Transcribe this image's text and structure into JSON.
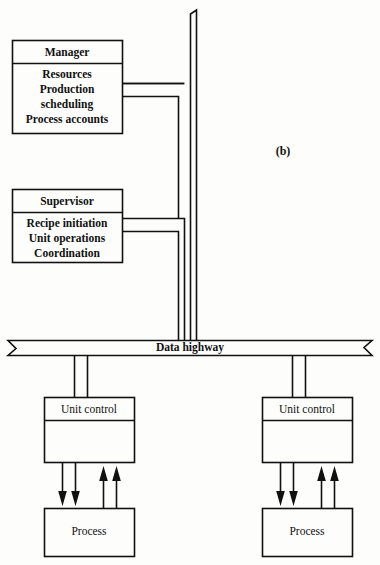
{
  "figure": {
    "caption": "(b)",
    "bus_label": "Data highway"
  },
  "nodes": {
    "manager": {
      "title": "Manager",
      "lines": [
        "Resources",
        "Production",
        "scheduling",
        "Process accounts"
      ]
    },
    "supervisor": {
      "title": "Supervisor",
      "lines": [
        "Recipe initiation",
        "Unit operations",
        "Coordination"
      ]
    },
    "unit_control_left": {
      "title": "Unit control"
    },
    "unit_control_right": {
      "title": "Unit control"
    },
    "process_left": {
      "title": "Process"
    },
    "process_right": {
      "title": "Process"
    }
  },
  "colors": {
    "line": "#111111",
    "background": "#fdfdfc",
    "text": "#111111"
  }
}
